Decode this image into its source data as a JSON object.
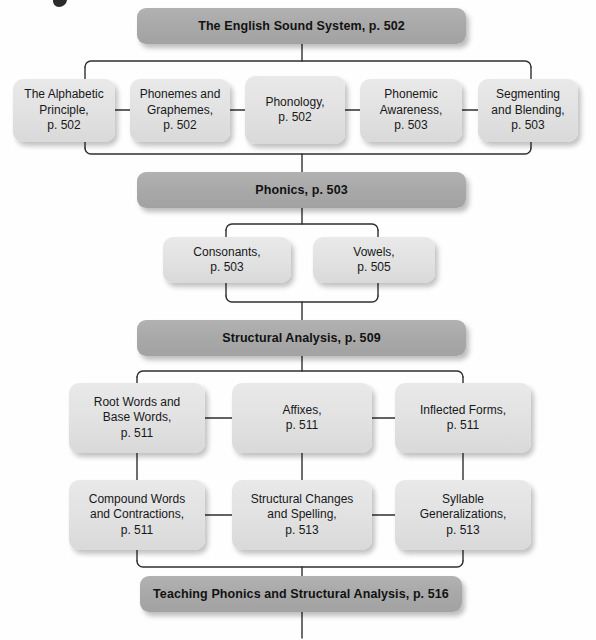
{
  "diagram": {
    "accent_bar_color": "#a9a9a9",
    "node_color": "#e2e2e2",
    "line_color": "#2f2f2f"
  },
  "bars": [
    {
      "id": "english-sound-system",
      "label": "The English Sound System, p. 502"
    },
    {
      "id": "phonics",
      "label": "Phonics, p. 503"
    },
    {
      "id": "structural-analysis",
      "label": "Structural Analysis, p. 509"
    },
    {
      "id": "teaching-phonics",
      "label": "Teaching Phonics and Structural Analysis, p. 516"
    }
  ],
  "nodes": [
    {
      "id": "alphabetic-principle",
      "line1": "The Alphabetic",
      "line2": "Principle,",
      "line3": "p. 502"
    },
    {
      "id": "phonemes-graphemes",
      "line1": "Phonemes and",
      "line2": "Graphemes,",
      "line3": "p. 502"
    },
    {
      "id": "phonology",
      "line1": "Phonology,",
      "line2": "p. 502",
      "line3": ""
    },
    {
      "id": "phonemic-awareness",
      "line1": "Phonemic",
      "line2": "Awareness,",
      "line3": "p. 503"
    },
    {
      "id": "segmenting-blending",
      "line1": "Segmenting",
      "line2": "and Blending,",
      "line3": "p. 503"
    },
    {
      "id": "consonants",
      "line1": "Consonants,",
      "line2": "p. 503",
      "line3": ""
    },
    {
      "id": "vowels",
      "line1": "Vowels,",
      "line2": "p. 505",
      "line3": ""
    },
    {
      "id": "root-base-words",
      "line1": "Root Words and",
      "line2": "Base Words,",
      "line3": "p. 511"
    },
    {
      "id": "affixes",
      "line1": "Affixes,",
      "line2": "p. 511",
      "line3": ""
    },
    {
      "id": "inflected-forms",
      "line1": "Inflected Forms,",
      "line2": "p. 511",
      "line3": ""
    },
    {
      "id": "compound-words",
      "line1": "Compound Words",
      "line2": "and Contractions,",
      "line3": "p. 511"
    },
    {
      "id": "structural-changes",
      "line1": "Structural Changes",
      "line2": "and Spelling,",
      "line3": "p. 513"
    },
    {
      "id": "syllable-generalizations",
      "line1": "Syllable",
      "line2": "Generalizations,",
      "line3": "p. 513"
    }
  ]
}
